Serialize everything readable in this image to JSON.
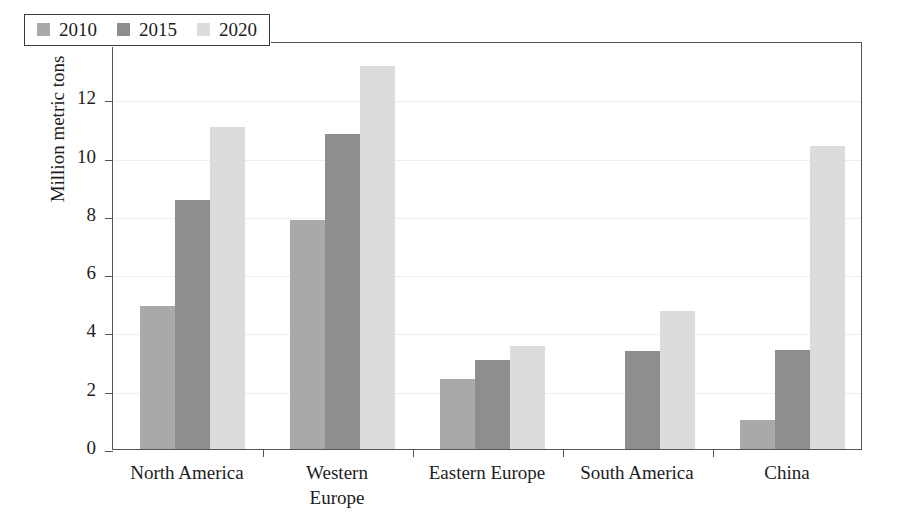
{
  "chart_data": {
    "type": "bar",
    "title": "",
    "xlabel": "",
    "ylabel": "Million metric tons",
    "categories": [
      "North America",
      "Western Europe",
      "Eastern Europe",
      "South America",
      "China"
    ],
    "series": [
      {
        "name": "2010",
        "color": "#a9a9a9",
        "values": [
          4.9,
          7.85,
          2.4,
          0,
          1.0
        ]
      },
      {
        "name": "2015",
        "color": "#8e8e8e",
        "values": [
          8.55,
          10.8,
          3.05,
          3.35,
          3.4
        ]
      },
      {
        "name": "2020",
        "color": "#dcdcdc",
        "values": [
          11.05,
          13.15,
          3.55,
          4.75,
          10.4
        ]
      }
    ],
    "ylim": [
      0,
      14
    ],
    "yticks": [
      0,
      2,
      4,
      6,
      8,
      10,
      12,
      14
    ],
    "ytick_labels": [
      "0",
      "2",
      "4",
      "6",
      "8",
      "10",
      "12",
      "14"
    ],
    "grid": true,
    "legend_position": "top-left",
    "legend_entries": [
      "2010",
      "2015",
      "2020"
    ],
    "frame_color": "#555555",
    "gridline_color": "#eeeeee",
    "background": "#ffffff"
  }
}
